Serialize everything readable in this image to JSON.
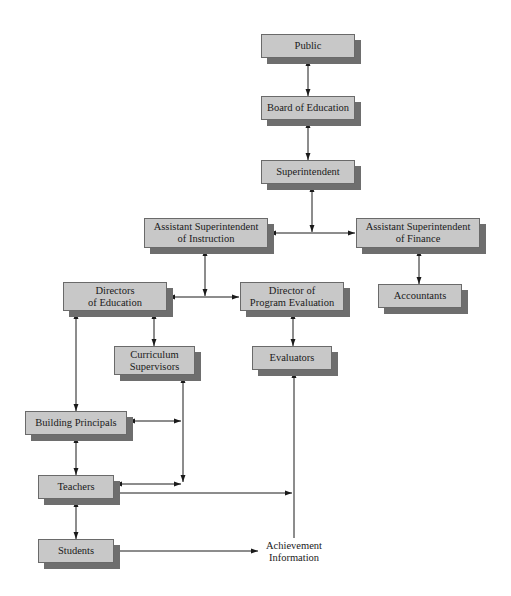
{
  "diagram": {
    "type": "organizational-chart",
    "nodes": [
      {
        "id": "public",
        "lines": [
          "Public"
        ],
        "x": 261,
        "y": 34,
        "w": 94,
        "h": 24
      },
      {
        "id": "board",
        "lines": [
          "Board of Education"
        ],
        "x": 261,
        "y": 96,
        "w": 94,
        "h": 24
      },
      {
        "id": "superintendent",
        "lines": [
          "Superintendent"
        ],
        "x": 261,
        "y": 160,
        "w": 94,
        "h": 24
      },
      {
        "id": "asst-instruction",
        "lines": [
          "Assistant Superintendent",
          "of Instruction"
        ],
        "x": 144,
        "y": 218,
        "w": 124,
        "h": 30
      },
      {
        "id": "asst-finance",
        "lines": [
          "Assistant Superintendent",
          "of Finance"
        ],
        "x": 356,
        "y": 218,
        "w": 124,
        "h": 30
      },
      {
        "id": "accountants",
        "lines": [
          "Accountants"
        ],
        "x": 378,
        "y": 284,
        "w": 84,
        "h": 24
      },
      {
        "id": "directors-education",
        "lines": [
          "Directors",
          "of Education"
        ],
        "x": 63,
        "y": 282,
        "w": 104,
        "h": 29
      },
      {
        "id": "director-program-evaluation",
        "lines": [
          "Director of",
          "Program Evaluation"
        ],
        "x": 240,
        "y": 282,
        "w": 104,
        "h": 29
      },
      {
        "id": "curriculum-supervisors",
        "lines": [
          "Curriculum",
          "Supervisors"
        ],
        "x": 114,
        "y": 346,
        "w": 81,
        "h": 29
      },
      {
        "id": "evaluators",
        "lines": [
          "Evaluators"
        ],
        "x": 252,
        "y": 346,
        "w": 80,
        "h": 24
      },
      {
        "id": "building-principals",
        "lines": [
          "Building Principals"
        ],
        "x": 25,
        "y": 411,
        "w": 102,
        "h": 24
      },
      {
        "id": "teachers",
        "lines": [
          "Teachers"
        ],
        "x": 38,
        "y": 475,
        "w": 76,
        "h": 24
      },
      {
        "id": "students",
        "lines": [
          "Students"
        ],
        "x": 38,
        "y": 539,
        "w": 76,
        "h": 24
      }
    ],
    "free_labels": [
      {
        "id": "achievement-information",
        "lines": [
          "Achievement",
          "Information"
        ],
        "x": 260,
        "y": 540,
        "w": 68
      }
    ],
    "edges": [
      {
        "from": "public",
        "to": "board",
        "type": "bidirectional"
      },
      {
        "from": "board",
        "to": "superintendent",
        "type": "bidirectional"
      },
      {
        "from": "superintendent",
        "to": "asst-instruction",
        "type": "directed"
      },
      {
        "from": "superintendent",
        "to": "asst-finance",
        "type": "directed"
      },
      {
        "from": "asst-finance",
        "to": "accountants",
        "type": "bidirectional"
      },
      {
        "from": "asst-instruction",
        "to": "directors-education",
        "type": "directed"
      },
      {
        "from": "asst-instruction",
        "to": "director-program-evaluation",
        "type": "directed"
      },
      {
        "from": "directors-education",
        "to": "curriculum-supervisors",
        "type": "bidirectional"
      },
      {
        "from": "director-program-evaluation",
        "to": "evaluators",
        "type": "bidirectional"
      },
      {
        "from": "directors-education",
        "to": "building-principals",
        "type": "bidirectional"
      },
      {
        "from": "curriculum-supervisors",
        "to": "building-principals",
        "type": "bidirectional"
      },
      {
        "from": "curriculum-supervisors",
        "to": "teachers",
        "type": "bidirectional"
      },
      {
        "from": "building-principals",
        "to": "teachers",
        "type": "bidirectional"
      },
      {
        "from": "teachers",
        "to": "students",
        "type": "bidirectional"
      },
      {
        "from": "teachers",
        "to": "evaluators",
        "type": "directed"
      },
      {
        "from": "students",
        "to": "achievement-information",
        "type": "directed"
      },
      {
        "from": "achievement-information",
        "to": "evaluators",
        "type": "directed"
      }
    ],
    "colors": {
      "box_fill": "#c8c8c8",
      "box_border": "#6a6a6a",
      "box_shadow": "#6e6e6e",
      "line": "#1a1a1a"
    }
  }
}
